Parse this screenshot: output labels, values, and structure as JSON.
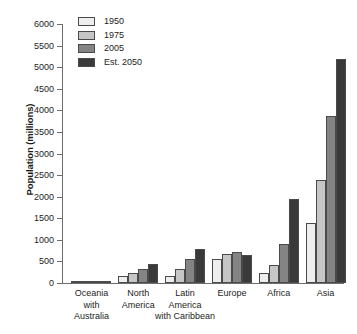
{
  "chart_data": {
    "type": "bar",
    "title": "",
    "xlabel": "",
    "ylabel": "Population (millions)",
    "ylim": [
      0,
      6000
    ],
    "ytick_step": 500,
    "grid": false,
    "legend_position": "top-left",
    "categories": [
      "Oceania\nwith\nAustralia",
      "North\nAmerica",
      "Latin\nAmerica\nwith Caribbean",
      "Europe",
      "Africa",
      "Asia"
    ],
    "ytick_labels": [
      "6000",
      "5500",
      "5000",
      "4500",
      "4000",
      "3500",
      "3000",
      "2500",
      "2000",
      "1500",
      "1000",
      "500",
      "0"
    ],
    "ytick_values": [
      6000,
      5500,
      5000,
      4500,
      4000,
      3500,
      3000,
      2500,
      2000,
      1500,
      1000,
      500,
      0
    ],
    "series": [
      {
        "name": "1950",
        "color": "#eeeeee",
        "values": [
          13,
          172,
          167,
          547,
          224,
          1382
        ]
      },
      {
        "name": "1975",
        "color": "#c6c6c6",
        "values": [
          21,
          243,
          325,
          676,
          408,
          2379
        ]
      },
      {
        "name": "2005",
        "color": "#848484",
        "values": [
          33,
          331,
          557,
          728,
          906,
          3880
        ]
      },
      {
        "name": "Est. 2050",
        "color": "#3a3a3a",
        "values": [
          48,
          438,
          783,
          653,
          1937,
          5180
        ]
      }
    ]
  },
  "colors": {
    "axis": "#6d6d6d",
    "text": "#1d1d1d",
    "bar_outline": "#4a4a4a",
    "background": "#ffffff"
  }
}
